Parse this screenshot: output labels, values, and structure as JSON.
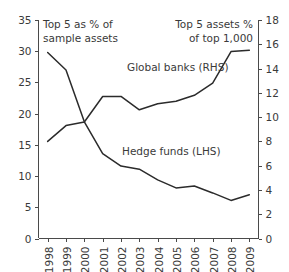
{
  "chart_data": {
    "type": "line",
    "title": "",
    "subtitle": "",
    "xlabel": "",
    "ylabel": "Top 5 as % of sample assets",
    "y2label": "Top 5 assets % of top 1,000",
    "grid": false,
    "legend": "inline-annotations",
    "categories": [
      "1998",
      "1999",
      "2000",
      "2001",
      "2002",
      "2003",
      "2004",
      "2005",
      "2006",
      "2007",
      "2008",
      "2009"
    ],
    "x": [
      1998,
      1999,
      2000,
      2001,
      2002,
      2003,
      2004,
      2005,
      2006,
      2007,
      2008,
      2009
    ],
    "ylim": [
      0,
      35
    ],
    "yticks": [
      0,
      5,
      10,
      15,
      20,
      25,
      30,
      35
    ],
    "y2lim": [
      0,
      18
    ],
    "y2ticks": [
      0,
      2,
      4,
      6,
      8,
      10,
      12,
      14,
      16,
      18
    ],
    "series": [
      {
        "name": "Hedge funds (LHS)",
        "axis": "left",
        "values": [
          29.8,
          27.0,
          18.7,
          13.6,
          11.6,
          11.1,
          9.4,
          8.1,
          8.4,
          7.3,
          6.1,
          7.0
        ]
      },
      {
        "name": "Global banks (RHS)",
        "axis": "right",
        "values": [
          8.0,
          9.3,
          9.6,
          11.7,
          11.7,
          10.6,
          11.1,
          11.3,
          11.8,
          12.8,
          15.4,
          15.5
        ]
      }
    ],
    "annotations": [
      {
        "id": "left-axis-caption",
        "text_line1": "Top 5 as % of",
        "text_line2": "sample assets"
      },
      {
        "id": "right-axis-caption",
        "text_line1": "Top 5 assets %",
        "text_line2": "of top 1,000"
      },
      {
        "id": "series-label-banks",
        "text": "Global banks (RHS)"
      },
      {
        "id": "series-label-hedge",
        "text": "Hedge funds (LHS)"
      }
    ],
    "colors": {
      "line": "#2b2b2b",
      "axis": "#4a4a4a",
      "text": "#3a3a3a",
      "background": "#ffffff"
    }
  }
}
